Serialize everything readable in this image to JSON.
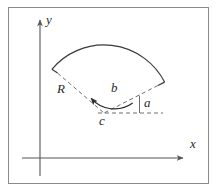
{
  "figure": {
    "background_color": "#ffffff",
    "frame": {
      "name": "figure-border",
      "stroke_color": "#8a8a8a",
      "x": 8,
      "y": 7,
      "width": 201,
      "height": 177
    },
    "axes": {
      "stroke_color": "#555555",
      "origin": {
        "x": 40,
        "y": 158
      },
      "x_axis": {
        "label": "x",
        "label_x": 190,
        "label_y": 142,
        "from_x": 22,
        "from_y": 158,
        "to_x": 185,
        "to_y": 158,
        "arrow": "right"
      },
      "y_axis": {
        "label": "y",
        "label_x": 46,
        "label_y": 17,
        "from_x": 40,
        "from_y": 176,
        "to_x": 40,
        "to_y": 18,
        "arrow": "up"
      }
    },
    "sector": {
      "center": {
        "x": 104,
        "y": 113
      },
      "outer_radius": 68,
      "inner_arc_radius": 21,
      "start_angle_deg": 27,
      "end_angle_deg": 140,
      "outer_arc_stroke": "#3a3a3a",
      "radius_line_stroke": "#6e6e6e",
      "dash_pattern": "4,3"
    },
    "labels": [
      {
        "name": "radius-label-R",
        "text": "R",
        "x": 61,
        "y": 88,
        "meaning": "outer radius of the sector"
      },
      {
        "name": "arc-angle-label-b",
        "text": "b",
        "x": 113,
        "y": 87,
        "meaning": "sector opening angle measured by inner arrow arc"
      },
      {
        "name": "center-label-c",
        "text": "c",
        "x": 100,
        "y": 118,
        "meaning": "center point of the sector"
      },
      {
        "name": "orientation-angle-label-a",
        "text": "a",
        "x": 146,
        "y": 100,
        "meaning": "angle between the right radius and the horizontal reference line"
      }
    ]
  }
}
